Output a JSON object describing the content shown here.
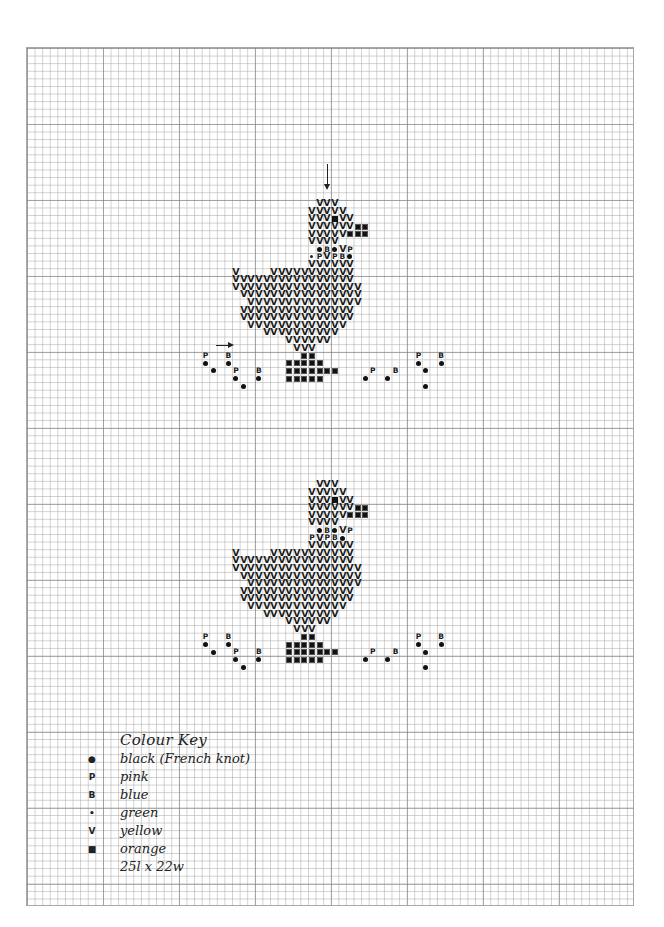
{
  "grid": {
    "origin_x": 26,
    "origin_y": 47,
    "cell": 7.6,
    "cols": 80,
    "rows": 113,
    "major_every": 10
  },
  "symbols": {
    "V": {
      "glyph": "V",
      "meaning": "yellow"
    },
    "P": {
      "glyph": "P",
      "meaning": "pink"
    },
    "B": {
      "glyph": "B",
      "meaning": "blue"
    },
    "g": {
      "glyph": "•",
      "meaning": "green"
    },
    "K": {
      "glyph": "●",
      "meaning": "black (French knot)"
    },
    "O": {
      "glyph": "■",
      "meaning": "orange"
    },
    "S": {
      "glyph": "■",
      "meaning": "black eye"
    }
  },
  "charts": [
    {
      "name": "duck-chart-top",
      "rows": [
        {
          "r": 20,
          "c": 38,
          "s": "VVV"
        },
        {
          "r": 21,
          "c": 37,
          "s": "VVVVV"
        },
        {
          "r": 22,
          "c": 37,
          "s": "VVVSVV"
        },
        {
          "r": 23,
          "c": 37,
          "s": "VVVVVVOO"
        },
        {
          "r": 24,
          "c": 37,
          "s": "VVVVVOOO"
        },
        {
          "r": 25,
          "c": 37,
          "s": "VVVV"
        },
        {
          "r": 26,
          "c": 38,
          "s": "KBKVP"
        },
        {
          "r": 27,
          "c": 37,
          "s": "gPVPBK"
        },
        {
          "r": 28,
          "c": 37,
          "s": "VVVVVV"
        },
        {
          "r": 29,
          "c": 27,
          "s": "V....VVVVVVVVVVV"
        },
        {
          "r": 30,
          "c": 27,
          "s": "VVVVVVVVVVVVVVVV"
        },
        {
          "r": 31,
          "c": 27,
          "s": "VVVVVVVVVVVVVVVVV"
        },
        {
          "r": 32,
          "c": 28,
          "s": "VVVVVVVVVVVVVVVV"
        },
        {
          "r": 33,
          "c": 29,
          "s": "VVVVVVVVVVVVVVV"
        },
        {
          "r": 34,
          "c": 28,
          "s": "VVVVVVVVVVVVVVV"
        },
        {
          "r": 35,
          "c": 28,
          "s": "VVVVVVVVVVVVVVV"
        },
        {
          "r": 36,
          "c": 29,
          "s": "VVVVVVVVVVVVV"
        },
        {
          "r": 37,
          "c": 31,
          "s": "VVVVVVVVVV"
        },
        {
          "r": 38,
          "c": 34,
          "s": "VVVVVV"
        },
        {
          "r": 39,
          "c": 35,
          "s": "VVV"
        },
        {
          "r": 40,
          "c": 23,
          "s": "P..B.........OO.............P..B"
        },
        {
          "r": 41,
          "c": 23,
          "s": "K..K.......OOOOO............K..K"
        },
        {
          "r": 42,
          "c": 24,
          "s": "K..P..B...OOOOOOO....P..B...K"
        },
        {
          "r": 43,
          "c": 27,
          "s": "K..K...OOOOO.....K..K"
        },
        {
          "r": 44,
          "c": 28,
          "s": "K.......................K"
        }
      ]
    },
    {
      "name": "duck-chart-bottom",
      "rows": [
        {
          "r": 57,
          "c": 38,
          "s": "VVV"
        },
        {
          "r": 58,
          "c": 37,
          "s": "VVVVV"
        },
        {
          "r": 59,
          "c": 37,
          "s": "VVVSVV"
        },
        {
          "r": 60,
          "c": 37,
          "s": "VVVVVVOO"
        },
        {
          "r": 61,
          "c": 37,
          "s": "VVVVVOOO"
        },
        {
          "r": 62,
          "c": 37,
          "s": "VVVV"
        },
        {
          "r": 63,
          "c": 38,
          "s": "KBKVP"
        },
        {
          "r": 64,
          "c": 37,
          "s": "PVPBK"
        },
        {
          "r": 65,
          "c": 37,
          "s": "VVVVVV"
        },
        {
          "r": 66,
          "c": 27,
          "s": "V....VVVVVVVVVVV"
        },
        {
          "r": 67,
          "c": 27,
          "s": "VVVVVVVVVVVVVVVV"
        },
        {
          "r": 68,
          "c": 27,
          "s": "VVVVVVVVVVVVVVVVV"
        },
        {
          "r": 69,
          "c": 28,
          "s": "VVVVVVVVVVVVVVVV"
        },
        {
          "r": 70,
          "c": 29,
          "s": "VVVVVVVVVVVVVVV"
        },
        {
          "r": 71,
          "c": 28,
          "s": "VVVVVVVVVVVVVVV"
        },
        {
          "r": 72,
          "c": 28,
          "s": "VVVVVVVVVVVVVVV"
        },
        {
          "r": 73,
          "c": 29,
          "s": "VVVVVVVVVVVVV"
        },
        {
          "r": 74,
          "c": 31,
          "s": "VVVVVVVVVV"
        },
        {
          "r": 75,
          "c": 34,
          "s": "VVVVVV"
        },
        {
          "r": 76,
          "c": 35,
          "s": "VVV"
        },
        {
          "r": 77,
          "c": 23,
          "s": "P..B.........OO.............P..B"
        },
        {
          "r": 78,
          "c": 23,
          "s": "K..K.......OOOOO............K..K"
        },
        {
          "r": 79,
          "c": 24,
          "s": "K..P..B...OOOOOOO....P..B...K"
        },
        {
          "r": 80,
          "c": 27,
          "s": "K..K...OOOOO.....K..K"
        },
        {
          "r": 81,
          "c": 28,
          "s": "K.......................K"
        }
      ]
    }
  ],
  "center_arrows": {
    "down": {
      "x": 327,
      "y1": 164,
      "y2": 188
    },
    "right": {
      "x1": 216,
      "x2": 232,
      "y": 345
    }
  },
  "colour_key": {
    "title": "Colour Key",
    "items": [
      {
        "symbol": "●",
        "label": "black (French knot)"
      },
      {
        "symbol": "P",
        "label": "pink"
      },
      {
        "symbol": "B",
        "label": "blue"
      },
      {
        "symbol": "•",
        "label": "green"
      },
      {
        "symbol": "V",
        "label": "yellow"
      },
      {
        "symbol": "■",
        "label": "orange"
      }
    ],
    "size_note": "25l x 22w"
  }
}
